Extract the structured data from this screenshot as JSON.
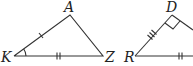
{
  "diagram": {
    "triangle1": {
      "vertices": {
        "A": "A",
        "K": "K",
        "Z": "Z"
      },
      "marks": {
        "KA": "single tick",
        "KZ": "double tick",
        "angle_K": "arc"
      }
    },
    "triangle2": {
      "vertices": {
        "D": "D",
        "R": "R"
      },
      "marks": {
        "RD": "triple tick",
        "R_base": "double tick",
        "angle_D": "right angle"
      }
    }
  }
}
